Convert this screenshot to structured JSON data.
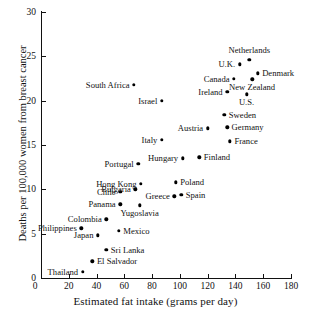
{
  "chart_data": {
    "type": "scatter",
    "title": "",
    "xlabel": "Estimated fat intake (grams per day)",
    "ylabel": "Deaths per 100,000 women from breast cancer",
    "xlim": [
      0,
      180
    ],
    "ylim": [
      0,
      30
    ],
    "xticks": [
      0,
      20,
      40,
      60,
      80,
      100,
      120,
      140,
      160,
      180
    ],
    "yticks": [
      0,
      5,
      10,
      15,
      20,
      25,
      30
    ],
    "grid": false,
    "legend": false,
    "points": [
      {
        "label": "Thailand",
        "x": 30,
        "y": 0.7,
        "label_pos": "left"
      },
      {
        "label": "El Salvador",
        "x": 37,
        "y": 1.9,
        "label_pos": "right"
      },
      {
        "label": "Sri Lanka",
        "x": 47,
        "y": 3.2,
        "label_pos": "right"
      },
      {
        "label": "Japan",
        "x": 41,
        "y": 4.8,
        "label_pos": "left"
      },
      {
        "label": "Mexico",
        "x": 56,
        "y": 5.3,
        "label_pos": "right"
      },
      {
        "label": "Philippines",
        "x": 29,
        "y": 5.6,
        "label_pos": "left"
      },
      {
        "label": "Colombia",
        "x": 47,
        "y": 6.6,
        "label_pos": "left"
      },
      {
        "label": "Panama",
        "x": 57,
        "y": 8.3,
        "label_pos": "left"
      },
      {
        "label": "Yugoslavia",
        "x": 71,
        "y": 8.2,
        "label_pos": "below"
      },
      {
        "label": "Greece",
        "x": 96,
        "y": 9.2,
        "label_pos": "left"
      },
      {
        "label": "Spain",
        "x": 101,
        "y": 9.4,
        "label_pos": "right"
      },
      {
        "label": "Chile",
        "x": 57,
        "y": 9.7,
        "label_pos": "left"
      },
      {
        "label": "Bulgaria",
        "x": 68,
        "y": 10.0,
        "label_pos": "left"
      },
      {
        "label": "Hong Kong",
        "x": 72,
        "y": 10.6,
        "label_pos": "left"
      },
      {
        "label": "Poland",
        "x": 97,
        "y": 10.8,
        "label_pos": "right"
      },
      {
        "label": "Portugal",
        "x": 70,
        "y": 12.9,
        "label_pos": "left"
      },
      {
        "label": "Hungary",
        "x": 102,
        "y": 13.5,
        "label_pos": "left"
      },
      {
        "label": "Finland",
        "x": 114,
        "y": 13.6,
        "label_pos": "right"
      },
      {
        "label": "Italy",
        "x": 87,
        "y": 15.6,
        "label_pos": "left"
      },
      {
        "label": "France",
        "x": 136,
        "y": 15.4,
        "label_pos": "right"
      },
      {
        "label": "Austria",
        "x": 120,
        "y": 16.9,
        "label_pos": "left"
      },
      {
        "label": "Germany",
        "x": 134,
        "y": 17.0,
        "label_pos": "right"
      },
      {
        "label": "Sweden",
        "x": 132,
        "y": 18.4,
        "label_pos": "right"
      },
      {
        "label": "Israel",
        "x": 87,
        "y": 20.0,
        "label_pos": "left"
      },
      {
        "label": "U.S.",
        "x": 148,
        "y": 20.7,
        "label_pos": "below"
      },
      {
        "label": "Ireland",
        "x": 134,
        "y": 21.0,
        "label_pos": "left"
      },
      {
        "label": "South Africa",
        "x": 67,
        "y": 21.8,
        "label_pos": "left"
      },
      {
        "label": "New Zealand",
        "x": 152,
        "y": 22.4,
        "label_pos": "below"
      },
      {
        "label": "Canada",
        "x": 139,
        "y": 22.5,
        "label_pos": "left"
      },
      {
        "label": "Denmark",
        "x": 156,
        "y": 23.1,
        "label_pos": "right"
      },
      {
        "label": "U.K.",
        "x": 143,
        "y": 24.1,
        "label_pos": "left"
      },
      {
        "label": "Netherlands",
        "x": 150,
        "y": 24.6,
        "label_pos": "above"
      }
    ]
  }
}
